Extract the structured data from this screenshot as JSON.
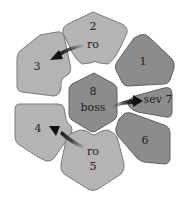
{
  "diagram": {
    "title": "",
    "colors": {
      "light_tile": "#b4b4b4",
      "dark_tile": "#8c8c8c",
      "arrow": "#2a2a2a",
      "background": "#ffffff"
    },
    "tiles": [
      {
        "id": "1",
        "label_top": "1",
        "label_bottom": "",
        "tone": "dark"
      },
      {
        "id": "2",
        "label_top": "2",
        "label_bottom": "ro",
        "tone": "light"
      },
      {
        "id": "3",
        "label_top": "3",
        "label_bottom": "",
        "tone": "light"
      },
      {
        "id": "4",
        "label_top": "4",
        "label_bottom": "",
        "tone": "light"
      },
      {
        "id": "5",
        "label_top": "ro",
        "label_bottom": "5",
        "tone": "light"
      },
      {
        "id": "6",
        "label_top": "6",
        "label_bottom": "",
        "tone": "dark"
      },
      {
        "id": "7",
        "label_top": "sev 7",
        "label_bottom": "",
        "tone": "dark"
      },
      {
        "id": "8",
        "label_top": "8",
        "label_bottom": "boss",
        "tone": "dark"
      }
    ],
    "arrows": [
      {
        "from": "2",
        "to": "3"
      },
      {
        "from": "8",
        "to": "7"
      },
      {
        "from": "5",
        "to": "4"
      }
    ]
  }
}
